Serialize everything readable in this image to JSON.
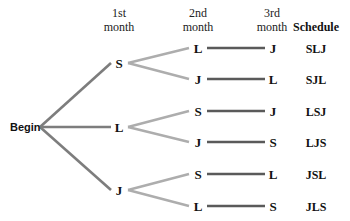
{
  "headers": {
    "first_month": [
      "1st",
      "month"
    ],
    "second_month": [
      "2nd",
      "month"
    ],
    "third_month": [
      "3rd",
      "month"
    ],
    "schedule": "Schedule"
  },
  "root": "Begin",
  "colors": {
    "root_branch": "#7d7d7d",
    "first_branch": "#adadad",
    "second_branch": "#5a5a5a",
    "text": "#111111"
  },
  "tree": [
    {
      "label": "S",
      "children": [
        {
          "label": "L",
          "leaf": "J",
          "schedule": "SLJ"
        },
        {
          "label": "J",
          "leaf": "L",
          "schedule": "SJL"
        }
      ]
    },
    {
      "label": "L",
      "children": [
        {
          "label": "S",
          "leaf": "J",
          "schedule": "LSJ"
        },
        {
          "label": "J",
          "leaf": "S",
          "schedule": "LJS"
        }
      ]
    },
    {
      "label": "J",
      "children": [
        {
          "label": "S",
          "leaf": "L",
          "schedule": "JSL"
        },
        {
          "label": "L",
          "leaf": "S",
          "schedule": "JLS"
        }
      ]
    }
  ]
}
